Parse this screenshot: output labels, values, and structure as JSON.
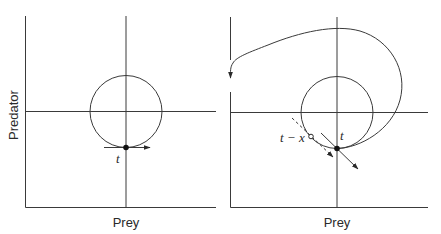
{
  "figure": {
    "panels": [
      {
        "id": "left",
        "x_label": "Prey",
        "y_label": "Predator",
        "point_label": "t",
        "description": "Circular predator-prey orbit; solid point at time t with horizontal tangent arrow"
      },
      {
        "id": "right",
        "x_label": "Prey",
        "point_label": "t",
        "delayed_point_label": "t − x",
        "description": "Circular orbit with delayed state t − x (open circle, dashed tangent) and current state t (solid point, solid arrow); outer spiral trajectory loops out and runs down the predator axis"
      }
    ]
  },
  "colors": {
    "line": "#3a3a3a",
    "text": "#2a2a2a",
    "background": "#ffffff"
  }
}
